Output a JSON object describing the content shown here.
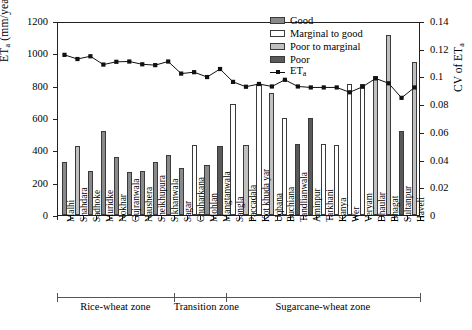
{
  "axes": {
    "y_left_label": "ET",
    "y_left_sub": "a",
    "y_left_unit": " (mm/year)",
    "y_right_label": "CV of ET",
    "y_right_sub": "a",
    "y_left_ticks": [
      "0",
      "200",
      "400",
      "600",
      "800",
      "1000",
      "1200"
    ],
    "y_right_ticks": [
      "0",
      "0.02",
      "0.04",
      "0.06",
      "0.08",
      "0.1",
      "0.12",
      "0.14"
    ],
    "ylim_left": [
      0,
      1200
    ],
    "ylim_right": [
      0,
      0.14
    ]
  },
  "legend": {
    "items": [
      {
        "label": "Good",
        "color": "#8a8a8a"
      },
      {
        "label": "Marginal to good",
        "color": "#ffffff"
      },
      {
        "label": "Poor to marginal",
        "color": "#c0c0c0"
      },
      {
        "label": "Poor",
        "color": "#5a5a5a"
      }
    ],
    "line_label": "ET",
    "line_sub": "a"
  },
  "zones": [
    {
      "label": "Rice-wheat zone",
      "start": 0,
      "end": 9
    },
    {
      "label": "Transition zone",
      "start": 9,
      "end": 13
    },
    {
      "label": "Sugarcane-wheat zone",
      "start": 13,
      "end": 28
    }
  ],
  "chart_data": {
    "type": "bar",
    "title": "",
    "xlabel": "",
    "ylabel": "ET_a (mm/year)",
    "y2label": "CV of ET_a",
    "ylim": [
      0,
      1200
    ],
    "y2lim": [
      0,
      0.14
    ],
    "grid": false,
    "legend_position": "top-center",
    "categories": [
      "Malhi",
      "Shahdara",
      "Sadhoke",
      "Muridke",
      "Nokhar",
      "Gujranwala",
      "Naushera",
      "Sheikhupura",
      "Sikhanwala",
      "Sagar",
      "Chuharkana",
      "Mohlan",
      "Mangtanwala",
      "Sangla",
      "Paccadala",
      "Kot khuda yar",
      "Uqbana",
      "Buchiana",
      "Tandlianwala",
      "Aminpur",
      "Tarkhani",
      "Kanya",
      "Wer",
      "Veryam",
      "Dhaular",
      "Bhagat",
      "Sultanpur",
      "Haveli"
    ],
    "series": [
      {
        "name": "ET_a (bars, mm/year)",
        "axis": "left",
        "type": "bar",
        "values": [
          330,
          425,
          270,
          520,
          360,
          265,
          275,
          330,
          370,
          290,
          435,
          310,
          425,
          685,
          430,
          810,
          755,
          600,
          440,
          600,
          440,
          435,
          810,
          810,
          860,
          1115,
          520,
          945
        ],
        "quality": [
          "Good",
          "Poor to marginal",
          "Good",
          "Good",
          "Good",
          "Good",
          "Good",
          "Good",
          "Good",
          "Good",
          "Marginal to good",
          "Good",
          "Poor",
          "Marginal to good",
          "Poor to marginal",
          "Marginal to good",
          "Poor to marginal",
          "Marginal to good",
          "Poor",
          "Poor",
          "Marginal to good",
          "Marginal to good",
          "Marginal to good",
          "Marginal to good",
          "Poor to marginal",
          "Poor to marginal",
          "Poor",
          "Poor to marginal"
        ]
      },
      {
        "name": "ET_a",
        "axis": "right",
        "type": "line",
        "marker": "square",
        "values": [
          0.117,
          0.114,
          0.116,
          0.11,
          0.112,
          0.1122,
          0.1102,
          0.1096,
          0.1122,
          0.1035,
          0.1045,
          0.101,
          0.1068,
          0.0975,
          0.094,
          0.096,
          0.0942,
          0.099,
          0.0942,
          0.0935,
          0.0935,
          0.0935,
          0.09,
          0.094,
          0.1,
          0.0965,
          0.086,
          0.0935
        ]
      }
    ]
  }
}
